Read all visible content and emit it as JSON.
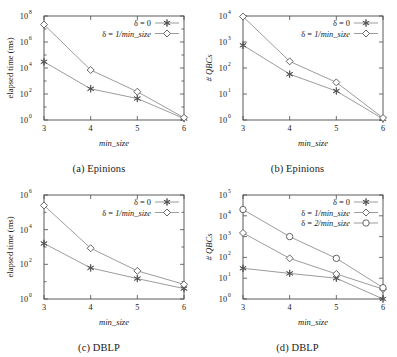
{
  "figure": {
    "background": "#ffffff",
    "line_color": "#8a8a8a",
    "marker_color": "#555555",
    "axis_color": "#4a4a4a"
  },
  "panels": [
    {
      "id": "a",
      "caption": "(a) Epinions",
      "xlabel": "min_size",
      "ylabel": "elapsed time (ms)",
      "ylabel_italic": false,
      "xticks": [
        "3",
        "4",
        "5",
        "6"
      ],
      "yticks": [
        {
          "mantissa": "10",
          "exp": "0"
        },
        {
          "mantissa": "10",
          "exp": "2"
        },
        {
          "mantissa": "10",
          "exp": "4"
        },
        {
          "mantissa": "10",
          "exp": "6"
        },
        {
          "mantissa": "10",
          "exp": "8"
        }
      ],
      "legend": [
        {
          "prefix": "δ = ",
          "value": "0",
          "value_italic": false,
          "marker": "star"
        },
        {
          "prefix": "δ = ",
          "value": "1/min_size",
          "value_italic": true,
          "marker": "diamond"
        }
      ],
      "chart_data": {
        "type": "line",
        "title": "(a) Epinions",
        "xlabel": "min_size",
        "ylabel": "elapsed time (ms)",
        "yscale": "log",
        "xlim": [
          3,
          6
        ],
        "ylim": [
          1,
          100000000
        ],
        "grid": false,
        "legend_position": "top-right",
        "x": [
          3,
          4,
          5,
          6
        ],
        "series": [
          {
            "name": "δ = 0",
            "marker": "star",
            "values": [
              30000,
              250,
              45,
              1.3
            ]
          },
          {
            "name": "δ = 1/min_size",
            "marker": "diamond",
            "values": [
              22000000,
              7000,
              150,
              1.5
            ]
          }
        ]
      }
    },
    {
      "id": "b",
      "caption": "(b) Epinions",
      "xlabel": "min_size",
      "ylabel": "# QBCs",
      "ylabel_italic": true,
      "xticks": [
        "3",
        "4",
        "5",
        "6"
      ],
      "yticks": [
        {
          "mantissa": "10",
          "exp": "0"
        },
        {
          "mantissa": "10",
          "exp": "1"
        },
        {
          "mantissa": "10",
          "exp": "2"
        },
        {
          "mantissa": "10",
          "exp": "3"
        },
        {
          "mantissa": "10",
          "exp": "4"
        }
      ],
      "legend": [
        {
          "prefix": "δ = ",
          "value": "0",
          "value_italic": false,
          "marker": "star"
        },
        {
          "prefix": "δ = ",
          "value": "1/min_size",
          "value_italic": true,
          "marker": "diamond"
        }
      ],
      "chart_data": {
        "type": "line",
        "title": "(b) Epinions",
        "xlabel": "min_size",
        "ylabel": "# QBCs",
        "yscale": "log",
        "xlim": [
          3,
          6
        ],
        "ylim": [
          1,
          10000
        ],
        "grid": false,
        "legend_position": "top-right",
        "x": [
          3,
          4,
          5,
          6
        ],
        "series": [
          {
            "name": "δ = 0",
            "marker": "star",
            "values": [
              750,
              58,
              13,
              1.1
            ]
          },
          {
            "name": "δ = 1/min_size",
            "marker": "diamond",
            "values": [
              9500,
              180,
              28,
              1.2
            ]
          }
        ]
      }
    },
    {
      "id": "c",
      "caption": "(c) DBLP",
      "xlabel": "min_size",
      "ylabel": "elapsed time (ms)",
      "ylabel_italic": false,
      "xticks": [
        "3",
        "4",
        "5",
        "6"
      ],
      "yticks": [
        {
          "mantissa": "10",
          "exp": "0"
        },
        {
          "mantissa": "10",
          "exp": "2"
        },
        {
          "mantissa": "10",
          "exp": "4"
        },
        {
          "mantissa": "10",
          "exp": "6"
        }
      ],
      "legend": [
        {
          "prefix": "δ = ",
          "value": "0",
          "value_italic": false,
          "marker": "star"
        },
        {
          "prefix": "δ = ",
          "value": "1/min_size",
          "value_italic": true,
          "marker": "diamond"
        }
      ],
      "chart_data": {
        "type": "line",
        "title": "(c) DBLP",
        "xlabel": "min_size",
        "ylabel": "elapsed time (ms)",
        "yscale": "log",
        "xlim": [
          3,
          6
        ],
        "ylim": [
          1,
          1000000
        ],
        "grid": false,
        "legend_position": "top-right",
        "x": [
          3,
          4,
          5,
          6
        ],
        "series": [
          {
            "name": "δ = 0",
            "marker": "star",
            "values": [
              1600,
              62,
              15,
              4
            ]
          },
          {
            "name": "δ = 1/min_size",
            "marker": "diamond",
            "values": [
              250000,
              850,
              42,
              7
            ]
          }
        ]
      }
    },
    {
      "id": "d",
      "caption": "(d) DBLP",
      "xlabel": "min_size",
      "ylabel": "# QBCs",
      "ylabel_italic": true,
      "xticks": [
        "3",
        "4",
        "5",
        "6"
      ],
      "yticks": [
        {
          "mantissa": "10",
          "exp": "0"
        },
        {
          "mantissa": "10",
          "exp": "1"
        },
        {
          "mantissa": "10",
          "exp": "2"
        },
        {
          "mantissa": "10",
          "exp": "3"
        },
        {
          "mantissa": "10",
          "exp": "4"
        },
        {
          "mantissa": "10",
          "exp": "5"
        }
      ],
      "legend": [
        {
          "prefix": "δ = ",
          "value": "0",
          "value_italic": false,
          "marker": "star"
        },
        {
          "prefix": "δ = ",
          "value": "1/min_size",
          "value_italic": true,
          "marker": "diamond"
        },
        {
          "prefix": "δ = ",
          "value": "2/min_size",
          "value_italic": true,
          "marker": "circle"
        }
      ],
      "chart_data": {
        "type": "line",
        "title": "(d) DBLP",
        "xlabel": "min_size",
        "ylabel": "# QBCs",
        "yscale": "log",
        "xlim": [
          3,
          6
        ],
        "ylim": [
          1,
          100000
        ],
        "grid": false,
        "legend_position": "top-right",
        "x": [
          3,
          4,
          5,
          6
        ],
        "series": [
          {
            "name": "δ = 0",
            "marker": "star",
            "values": [
              30,
              17,
              10,
              1.0
            ]
          },
          {
            "name": "δ = 1/min_size",
            "marker": "diamond",
            "values": [
              1500,
              90,
              16,
              3.0
            ]
          },
          {
            "name": "δ = 2/min_size",
            "marker": "circle",
            "values": [
              20000,
              1000,
              90,
              3.5
            ]
          }
        ]
      }
    }
  ]
}
